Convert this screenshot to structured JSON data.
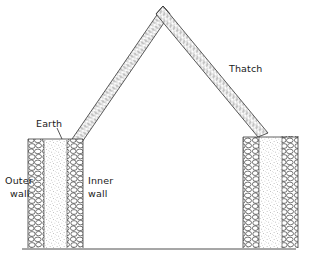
{
  "figure": {
    "kind": "cross-section-diagram",
    "background_color": "#ffffff",
    "ink_color": "#333333",
    "text_color": "#1a1a1a"
  },
  "labels": {
    "thatch": "Thatch",
    "earth": "Earth",
    "outer_wall_line1": "Outer",
    "outer_wall_line2": "wall",
    "inner_wall_line1": "Inner",
    "inner_wall_line2": "wall"
  },
  "parts": {
    "roof": {
      "name": "Thatch",
      "apex_x": 163,
      "apex_y": 6,
      "left_eave_x": 74,
      "left_eave_y": 141,
      "right_eave_x": 264,
      "right_eave_y": 133,
      "band_thickness": 11,
      "texture": "hatched-thatch-strokes"
    },
    "left_wall": {
      "outer_wall_x": 33,
      "inner_wall_x": 66,
      "top_y": 139,
      "bottom_y": 248,
      "fill": "earth-stipple",
      "stone_texture": "rubble-stones"
    },
    "right_wall": {
      "outer_wall_x": 273,
      "inner_wall_x": 247,
      "top_y": 136,
      "bottom_y": 248,
      "fill": "earth-stipple",
      "stone_texture": "rubble-stones"
    },
    "ground": {
      "name": "ground-line",
      "x1": 22,
      "x2": 296,
      "y": 249
    }
  }
}
